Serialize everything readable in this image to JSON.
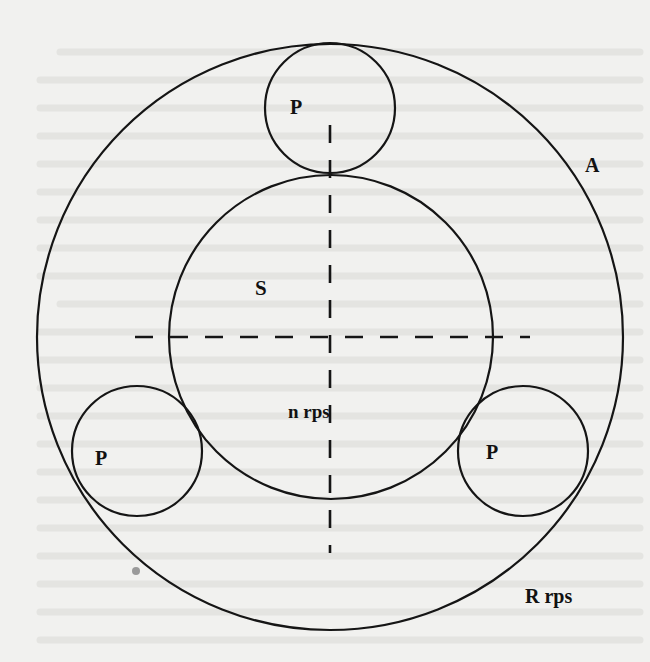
{
  "diagram": {
    "type": "epicyclic-gear-train",
    "colors": {
      "background": "#f1f1ef",
      "stroke": "#151515",
      "bleed_text": "#e2e2df",
      "dot": "#9a9a9a"
    },
    "labels": {
      "planet_top": "P",
      "planet_left": "P",
      "planet_right": "P",
      "sun": "S",
      "arm": "A",
      "sun_speed": "n rps",
      "ring_speed": "R rps"
    },
    "geometry": {
      "ring": {
        "cx": 330,
        "cy": 337,
        "r": 293
      },
      "sun": {
        "cx": 331,
        "cy": 337,
        "r": 162
      },
      "planets": [
        {
          "name": "top",
          "cx": 330,
          "cy": 108,
          "r": 65
        },
        {
          "name": "left",
          "cx": 137,
          "cy": 451,
          "r": 65
        },
        {
          "name": "right",
          "cx": 523,
          "cy": 451,
          "r": 65
        }
      ],
      "h_axis": {
        "x1": 135,
        "x2": 530,
        "y": 337
      },
      "v_axis": {
        "x": 330,
        "y1": 125,
        "y2": 553
      }
    }
  }
}
